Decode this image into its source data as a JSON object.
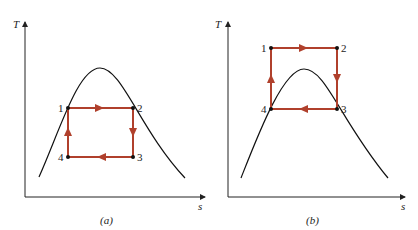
{
  "colors": {
    "cycle": "#b0402c",
    "curve": "#111111",
    "axis": "#222222"
  },
  "panels": [
    {
      "caption": "(a)",
      "y_axis_label": "T",
      "x_axis_label": "s",
      "points": [
        {
          "label": "1"
        },
        {
          "label": "2"
        },
        {
          "label": "3"
        },
        {
          "label": "4"
        }
      ]
    },
    {
      "caption": "(b)",
      "y_axis_label": "T",
      "x_axis_label": "s",
      "points": [
        {
          "label": "1"
        },
        {
          "label": "2"
        },
        {
          "label": "3"
        },
        {
          "label": "4"
        }
      ]
    }
  ]
}
